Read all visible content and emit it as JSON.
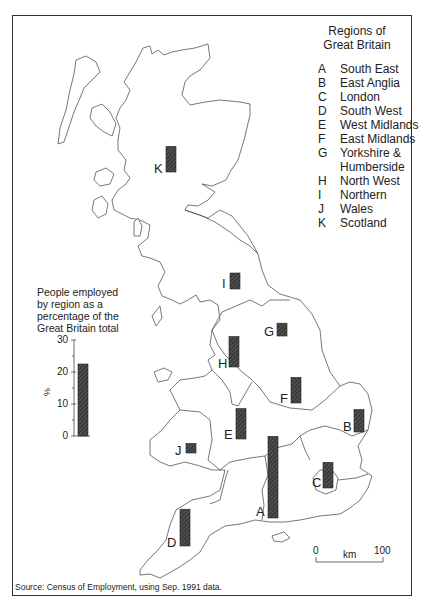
{
  "legend": {
    "title": "Regions of\nGreat Britain",
    "title_line1": "Regions of",
    "title_line2": "Great Britain",
    "items": [
      {
        "code": "A",
        "name": "South East"
      },
      {
        "code": "B",
        "name": "East Anglia"
      },
      {
        "code": "C",
        "name": "London"
      },
      {
        "code": "D",
        "name": "South West"
      },
      {
        "code": "E",
        "name": "West Midlands"
      },
      {
        "code": "F",
        "name": "East Midlands"
      },
      {
        "code": "G",
        "name": "Yorkshire &\nHumberside"
      },
      {
        "code": "H",
        "name": "North West"
      },
      {
        "code": "I",
        "name": "Northern"
      },
      {
        "code": "J",
        "name": "Wales"
      },
      {
        "code": "K",
        "name": "Scotland"
      }
    ]
  },
  "key": {
    "title": "People employed by region as a percentage of the Great Britain total",
    "title_lines": [
      "People employed",
      "by region as a",
      "percentage of the",
      "Great Britain total"
    ],
    "axis_label": "%",
    "ticks": [
      "30",
      "20",
      "10",
      "0"
    ],
    "example_value": 22.5
  },
  "scale_bar": {
    "start": "0",
    "unit": "km",
    "end": "100"
  },
  "source": "Source: Census of Employment, using Sep. 1991 data.",
  "colors": {
    "bar": "#333333",
    "outline": "#555555",
    "frame": "#333333"
  },
  "chart_data": {
    "type": "bar",
    "title": "People employed by region as a percentage of the Great Britain total",
    "xlabel": "Region",
    "ylabel": "%",
    "ylim": [
      0,
      30
    ],
    "yticks": [
      0,
      10,
      20,
      30
    ],
    "categories": [
      "A South East",
      "B East Anglia",
      "C London",
      "D South West",
      "E West Midlands",
      "F East Midlands",
      "G Yorkshire & Humberside",
      "H North West",
      "I Northern",
      "J Wales",
      "K Scotland"
    ],
    "values": [
      25.5,
      7,
      8,
      11.5,
      9.5,
      8,
      4,
      9.5,
      5,
      3,
      8
    ],
    "grid": false,
    "legend_position": "top-right",
    "source": "Census of Employment, using Sep. 1991 data"
  },
  "map_bars": [
    {
      "code": "A",
      "value": 25.5,
      "x": 268,
      "bottom": 518,
      "label_x": 256,
      "label_y": 505
    },
    {
      "code": "B",
      "value": 7,
      "x": 354,
      "bottom": 432,
      "label_x": 343,
      "label_y": 420
    },
    {
      "code": "C",
      "value": 8,
      "x": 323,
      "bottom": 488,
      "label_x": 312,
      "label_y": 476
    },
    {
      "code": "D",
      "value": 11.5,
      "x": 180,
      "bottom": 546,
      "label_x": 167,
      "label_y": 536
    },
    {
      "code": "E",
      "value": 9.5,
      "x": 236,
      "bottom": 439,
      "label_x": 224,
      "label_y": 428
    },
    {
      "code": "F",
      "value": 8,
      "x": 291,
      "bottom": 403,
      "label_x": 280,
      "label_y": 392
    },
    {
      "code": "G",
      "value": 4,
      "x": 277,
      "bottom": 336,
      "label_x": 264,
      "label_y": 325
    },
    {
      "code": "H",
      "value": 9.5,
      "x": 229,
      "bottom": 367,
      "label_x": 218,
      "label_y": 357
    },
    {
      "code": "I",
      "value": 5,
      "x": 230,
      "bottom": 289,
      "label_x": 222,
      "label_y": 277
    },
    {
      "code": "J",
      "value": 3,
      "x": 186,
      "bottom": 453,
      "label_x": 175,
      "label_y": 444
    },
    {
      "code": "K",
      "value": 8,
      "x": 166,
      "bottom": 172,
      "label_x": 154,
      "label_y": 162
    }
  ]
}
